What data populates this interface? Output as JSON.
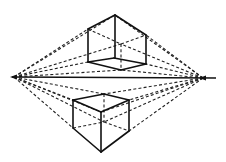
{
  "diagram": {
    "width": 226,
    "height": 162,
    "colors": {
      "ink": "#111111",
      "background": "#ffffff"
    },
    "horizon": {
      "x1": 12,
      "y1": 77,
      "x2": 216,
      "y2": 78
    },
    "vanishing_points": [
      {
        "name": "left-vanishing-point",
        "x": 14,
        "y": 77
      },
      {
        "name": "right-vanishing-point",
        "x": 203,
        "y": 78
      }
    ],
    "cubes": [
      {
        "name": "upper-cube",
        "position": "above horizon",
        "solid_edges": [
          [
            115,
            15,
            88,
            29
          ],
          [
            115,
            15,
            146,
            35
          ],
          [
            88,
            29,
            88,
            62
          ],
          [
            146,
            35,
            146,
            64
          ],
          [
            115,
            15,
            115,
            58
          ],
          [
            88,
            62,
            114,
            58
          ],
          [
            114,
            58,
            146,
            64
          ],
          [
            88,
            62,
            121,
            70
          ],
          [
            121,
            70,
            146,
            64
          ]
        ],
        "hidden_edges": [
          [
            121,
            44,
            121,
            70
          ],
          [
            88,
            29,
            121,
            44
          ],
          [
            121,
            44,
            146,
            35
          ]
        ]
      },
      {
        "name": "lower-cube",
        "position": "below horizon",
        "solid_edges": [
          [
            73,
            100,
            104,
            94
          ],
          [
            104,
            94,
            129,
            100
          ],
          [
            73,
            100,
            101,
            112
          ],
          [
            101,
            112,
            129,
            100
          ],
          [
            73,
            100,
            73,
            128
          ],
          [
            129,
            100,
            129,
            131
          ],
          [
            101,
            112,
            101,
            152
          ],
          [
            73,
            128,
            101,
            152
          ],
          [
            101,
            152,
            129,
            131
          ]
        ],
        "hidden_edges": [
          [
            104,
            94,
            104,
            122
          ],
          [
            73,
            128,
            104,
            122
          ],
          [
            104,
            122,
            129,
            131
          ]
        ]
      }
    ],
    "construction_lines": [
      [
        14,
        77,
        88,
        29
      ],
      [
        14,
        77,
        115,
        15
      ],
      [
        14,
        77,
        121,
        44
      ],
      [
        14,
        77,
        88,
        62
      ],
      [
        14,
        77,
        121,
        70
      ],
      [
        203,
        78,
        146,
        35
      ],
      [
        203,
        78,
        115,
        15
      ],
      [
        203,
        78,
        121,
        44
      ],
      [
        203,
        78,
        146,
        64
      ],
      [
        203,
        78,
        121,
        70
      ],
      [
        14,
        77,
        73,
        100
      ],
      [
        14,
        77,
        104,
        94
      ],
      [
        14,
        77,
        73,
        128
      ],
      [
        14,
        77,
        104,
        122
      ],
      [
        14,
        77,
        101,
        112
      ],
      [
        203,
        78,
        129,
        100
      ],
      [
        203,
        78,
        104,
        94
      ],
      [
        203,
        78,
        129,
        131
      ],
      [
        203,
        78,
        104,
        122
      ],
      [
        203,
        78,
        101,
        112
      ]
    ]
  }
}
